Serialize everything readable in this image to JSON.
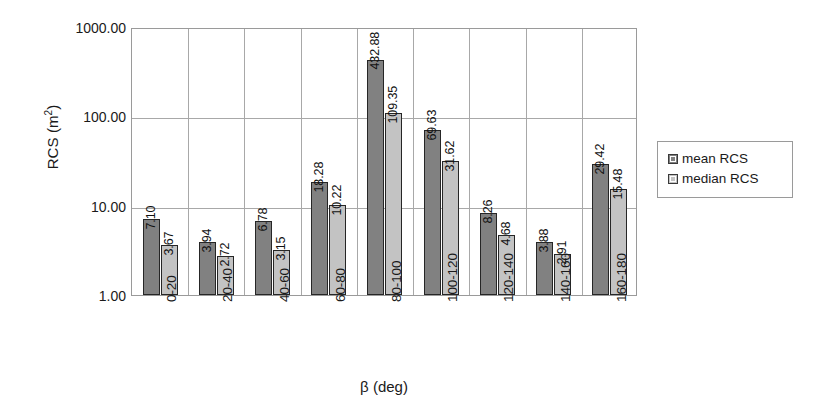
{
  "chart_data": {
    "type": "bar",
    "title": "",
    "xlabel": "β (deg)",
    "ylabel": "RCS (m²)",
    "ylabel_base": "RCS (m",
    "ylabel_sup": "2",
    "ylabel_tail": ")",
    "yscale": "log",
    "ylim": [
      1,
      1000
    ],
    "ytick_labels": [
      "1000.00",
      "100.00",
      "10.00",
      "1.00"
    ],
    "ytick_values": [
      1000,
      100,
      10,
      1
    ],
    "grid": true,
    "legend_position": "right",
    "categories": [
      "0-20",
      "20-40",
      "40-60",
      "60-80",
      "80-100",
      "100-120",
      "120-140",
      "140-160",
      "160-180"
    ],
    "series": [
      {
        "name": "mean RCS",
        "color": "#818181",
        "values": [
          7.1,
          3.94,
          6.78,
          18.28,
          432.88,
          69.63,
          8.26,
          3.88,
          29.42
        ],
        "labels": [
          "7.10",
          "3.94",
          "6.78",
          "18.28",
          "432.88",
          "69.63",
          "8.26",
          "3.88",
          "29.42"
        ]
      },
      {
        "name": "median RCS",
        "color": "#c3c3c3",
        "values": [
          3.67,
          2.72,
          3.15,
          10.22,
          109.35,
          31.62,
          4.68,
          2.91,
          15.48
        ],
        "labels": [
          "3.67",
          "2.72",
          "3.15",
          "10.22",
          "109.35",
          "31.62",
          "4.68",
          "2.91",
          "15.48"
        ]
      }
    ]
  },
  "legend": {
    "items": [
      {
        "label": "mean RCS",
        "swatch": "mean"
      },
      {
        "label": "median RCS",
        "swatch": "median"
      }
    ]
  }
}
